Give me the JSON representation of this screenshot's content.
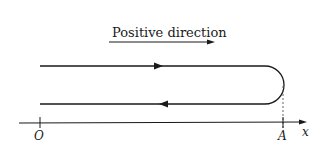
{
  "diagram": {
    "direction_label": "Positive direction",
    "axis_label": "x",
    "origin_label": "O",
    "point_label": "A",
    "line_color": "#1a1a1a"
  }
}
